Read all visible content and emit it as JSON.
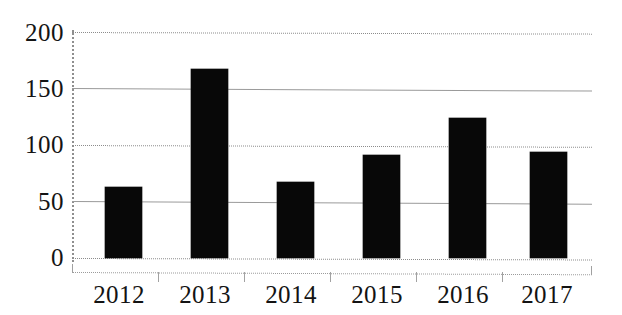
{
  "chart_data": {
    "type": "bar",
    "title": "",
    "subtitle": "",
    "xlabel": "",
    "ylabel": "",
    "categories": [
      "2012",
      "2013",
      "2014",
      "2015",
      "2016",
      "2017"
    ],
    "values": [
      63,
      167,
      67,
      91,
      124,
      94
    ],
    "ylim": [
      0,
      200
    ],
    "yticks": [
      0,
      50,
      100,
      150,
      200
    ],
    "ytick_labels": [
      "0",
      "50",
      "100",
      "150",
      "200"
    ],
    "grid": true,
    "gridline_styles": [
      "dotted",
      "solid",
      "dotted",
      "solid",
      "dotted"
    ],
    "legend": null,
    "legend_position": "none",
    "annotations": [],
    "bar_color": "#080808",
    "background_color": "#ffffff",
    "gridline_color": "#9a9a9a",
    "axis_color": "#8f8f8f"
  },
  "axes": {
    "y_tick_0": "0",
    "y_tick_50": "50",
    "y_tick_100": "100",
    "y_tick_150": "150",
    "y_tick_200": "200",
    "x_tick_0": "2012",
    "x_tick_1": "2013",
    "x_tick_2": "2014",
    "x_tick_3": "2015",
    "x_tick_4": "2016",
    "x_tick_5": "2017"
  }
}
